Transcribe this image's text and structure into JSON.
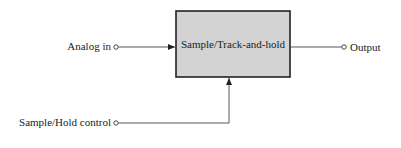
{
  "diagram": {
    "block": {
      "label": "Sample/Track-and-hold",
      "fill": "#d3d3d3",
      "stroke": "#222222"
    },
    "inputs": [
      {
        "label": "Analog in"
      },
      {
        "label": "Sample/Hold control"
      }
    ],
    "outputs": [
      {
        "label": "Output"
      }
    ],
    "line_color": "#444444"
  }
}
